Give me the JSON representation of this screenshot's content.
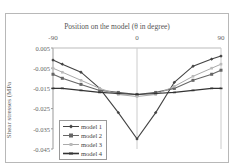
{
  "chart_data": {
    "type": "line",
    "title": "Position on the model (θ in degree)",
    "xlabel": "Position on the model (θ in degree)",
    "ylabel": "Shear stresses (MPa",
    "x_ticks": [
      "-90",
      "0",
      "90"
    ],
    "y_ticks": [
      "0.005",
      "-0.005",
      "-0.015",
      "-0.025",
      "-0.035",
      "-0.045"
    ],
    "xlim": [
      -90,
      90
    ],
    "ylim": [
      -0.045,
      0.005
    ],
    "grid": "vertical at 0, horizontal at top",
    "legend_position": "lower-left inside",
    "x": [
      -90,
      -80,
      -60,
      -40,
      -20,
      0,
      20,
      40,
      60,
      80,
      90
    ],
    "series": [
      {
        "name": "model 1",
        "color": "#444444",
        "marker": "diamond",
        "values": [
          -0.001,
          -0.003,
          -0.007,
          -0.015,
          -0.027,
          -0.04,
          -0.027,
          -0.012,
          -0.004,
          -0.0005,
          0.001
        ]
      },
      {
        "name": "model 2",
        "color": "#666666",
        "marker": "square",
        "values": [
          -0.008,
          -0.01,
          -0.013,
          -0.016,
          -0.017,
          -0.018,
          -0.017,
          -0.015,
          -0.011,
          -0.008,
          -0.006
        ]
      },
      {
        "name": "model 3",
        "color": "#aaaaaa",
        "marker": "cross",
        "values": [
          -0.005,
          -0.007,
          -0.011,
          -0.015,
          -0.018,
          -0.019,
          -0.018,
          -0.014,
          -0.009,
          -0.005,
          -0.003
        ]
      },
      {
        "name": "model 4",
        "color": "#333333",
        "marker": "dash",
        "values": [
          -0.015,
          -0.015,
          -0.016,
          -0.017,
          -0.0175,
          -0.018,
          -0.0175,
          -0.017,
          -0.016,
          -0.015,
          -0.015
        ]
      }
    ]
  },
  "legend": {
    "items": [
      "model 1",
      "model 2",
      "model 3",
      "model 4"
    ]
  }
}
